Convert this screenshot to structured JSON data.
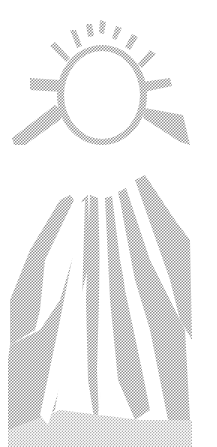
{
  "illustration": {
    "subject": "sun-with-rays",
    "style": "halftone",
    "colors": {
      "background": "#ffffff",
      "dots": "#8a8a8a",
      "sun": "#ffffff"
    }
  }
}
